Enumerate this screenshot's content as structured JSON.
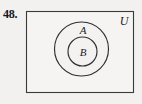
{
  "figure": {
    "problem_number": "48.",
    "type": "venn-diagram",
    "universe_label": "U",
    "outer_set_label": "A",
    "inner_set_label": "B",
    "colors": {
      "background": "#f2f1ef",
      "stroke": "#2f2f33",
      "rect_stroke": "#3a3a3e",
      "text": "#1c1c20"
    },
    "geometry": {
      "rectangle": {
        "x": 26,
        "y": 11,
        "width": 108,
        "height": 82
      },
      "outer_circle": {
        "cx": 81.5,
        "cy": 49,
        "r": 27
      },
      "inner_circle": {
        "cx": 82.5,
        "cy": 51.5,
        "r": 14.5
      },
      "universe_label_pos": {
        "x": 124,
        "y": 25
      },
      "outer_label_pos": {
        "x": 83,
        "y": 34
      },
      "inner_label_pos": {
        "x": 83,
        "y": 56
      }
    }
  }
}
